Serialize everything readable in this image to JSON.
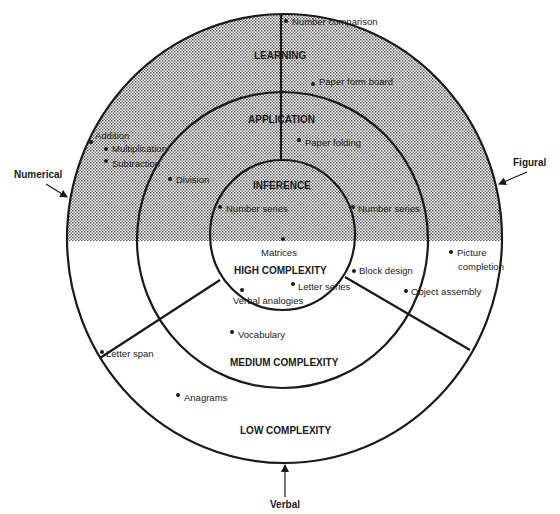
{
  "colors": {
    "ink": "#1a1a1a",
    "shade_dot": "#555555",
    "background": "#ffffff"
  },
  "axes": {
    "numerical": "Numerical",
    "figural": "Figural",
    "verbal": "Verbal"
  },
  "zones": {
    "learning": "LEARNING",
    "application": "APPLICATION",
    "inference": "INFERENCE",
    "high": "HIGH COMPLEXITY",
    "medium": "MEDIUM COMPLEXITY",
    "low": "LOW COMPLEXITY"
  },
  "tests": {
    "number_comparison": "Number comparison",
    "paper_form_board": "Paper form board",
    "paper_folding": "Paper folding",
    "addition": "Addition",
    "multiplication": "Multiplication",
    "subtraction": "Subtraction",
    "division": "Division",
    "number_series_left": "Number series",
    "number_series_right": "Number series",
    "matrices": "Matrices",
    "block_design": "Block design",
    "picture_completion_1": "Picture",
    "picture_completion_2": "completion",
    "letter_series": "Letter series",
    "verbal_analogies": "Verbal analogies",
    "object_assembly": "Object assembly",
    "vocabulary": "Vocabulary",
    "letter_span": "Letter span",
    "anagrams": "Anagrams"
  }
}
